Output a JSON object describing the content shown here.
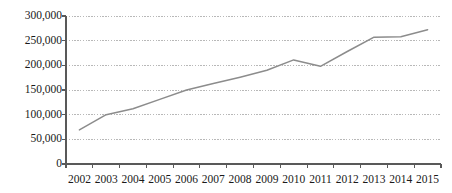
{
  "chart_data": {
    "type": "line",
    "title": "",
    "subtitle": "",
    "xlabel": "",
    "ylabel": "",
    "categories": [
      "2002",
      "2003",
      "2004",
      "2005",
      "2006",
      "2007",
      "2008",
      "2009",
      "2010",
      "2011",
      "2012",
      "2013",
      "2014",
      "2015"
    ],
    "series": [
      {
        "name": "",
        "values": [
          69000,
          100000,
          112000,
          131000,
          150000,
          163000,
          176000,
          190000,
          211000,
          198000,
          228000,
          257000,
          258000,
          272000
        ]
      }
    ],
    "ylim": [
      0,
      300000
    ],
    "yticks": [
      0,
      50000,
      100000,
      150000,
      200000,
      250000,
      300000
    ],
    "ytick_labels": [
      "0",
      "50,000",
      "100,000",
      "150,000",
      "200,000",
      "250,000",
      "300,000"
    ],
    "xtick_labels": [
      "2002",
      "2003",
      "2004",
      "2005",
      "2006",
      "2007",
      "2008",
      "2009",
      "2010",
      "2011",
      "2012",
      "2013",
      "2014",
      "2015"
    ],
    "grid": true,
    "grid_axis": "y",
    "grid_style": "dotted",
    "legend": false,
    "legend_position": "none",
    "markers": false,
    "colors": {
      "line": "#8c8c8c",
      "axis": "#595959",
      "grid": "#a6a6a6",
      "text": "#1a1a1a",
      "background": "#ffffff"
    },
    "annotations": []
  },
  "layout": {
    "plot_left": 66,
    "plot_right": 441,
    "plot_top": 16,
    "plot_bottom": 164
  }
}
